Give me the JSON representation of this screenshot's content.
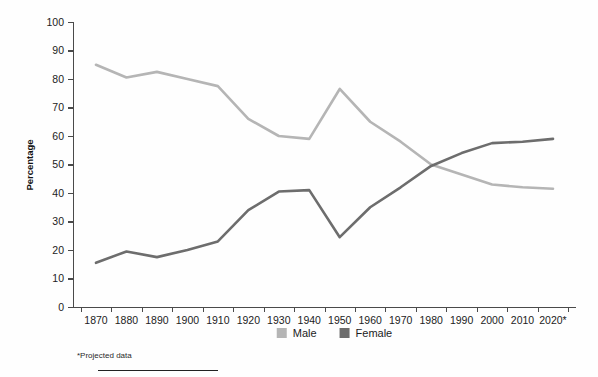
{
  "chart_data": {
    "type": "line",
    "title": "",
    "subtitle": "",
    "xlabel": "",
    "ylabel": "Percentage",
    "ylim": [
      0,
      100
    ],
    "ytick_step": 10,
    "yticks": [
      0,
      10,
      20,
      30,
      40,
      50,
      60,
      70,
      80,
      90,
      100
    ],
    "grid": false,
    "legend_position": "bottom-center",
    "categories": [
      "1870",
      "1880",
      "1890",
      "1900",
      "1910",
      "1920",
      "1930",
      "1940",
      "1950",
      "1960",
      "1970",
      "1980",
      "1990",
      "2000",
      "2010",
      "2020*"
    ],
    "x": [
      1870,
      1880,
      1890,
      1900,
      1910,
      1920,
      1930,
      1940,
      1950,
      1960,
      1970,
      1980,
      1990,
      2000,
      2010,
      2020
    ],
    "series": [
      {
        "name": "Male",
        "color": "#b5b5b5",
        "values": [
          85,
          80.5,
          82.5,
          80,
          77.5,
          66,
          60,
          59,
          76.5,
          65,
          58,
          50,
          46.5,
          43,
          42,
          41.5
        ]
      },
      {
        "name": "Female",
        "color": "#6d6d6d",
        "values": [
          15.5,
          19.5,
          17.5,
          20,
          23,
          34,
          40.5,
          41,
          24.5,
          35,
          42,
          49.5,
          54,
          57.5,
          58,
          59
        ]
      }
    ],
    "annotations": {
      "footnote": "*Projected data"
    }
  },
  "legend": {
    "items": [
      {
        "label": "Male",
        "swatch_color": "#b5b5b5"
      },
      {
        "label": "Female",
        "swatch_color": "#6d6d6d"
      }
    ]
  },
  "footnote": {
    "text": "*Projected data"
  },
  "axes": {
    "y_title": "Percentage",
    "y_labels": [
      "100",
      "90",
      "80",
      "70",
      "60",
      "50",
      "40",
      "30",
      "20",
      "10",
      "0"
    ],
    "x_labels": [
      "1870",
      "1880",
      "1890",
      "1900",
      "1910",
      "1920",
      "1930",
      "1940",
      "1950",
      "1960",
      "1970",
      "1980",
      "1990",
      "2000",
      "2010",
      "2020*"
    ]
  },
  "colors": {
    "male_line": "#b5b5b5",
    "female_line": "#6d6d6d",
    "axis": "#4a4a4a",
    "text": "#1c1c1c",
    "background": "#fefefe"
  }
}
